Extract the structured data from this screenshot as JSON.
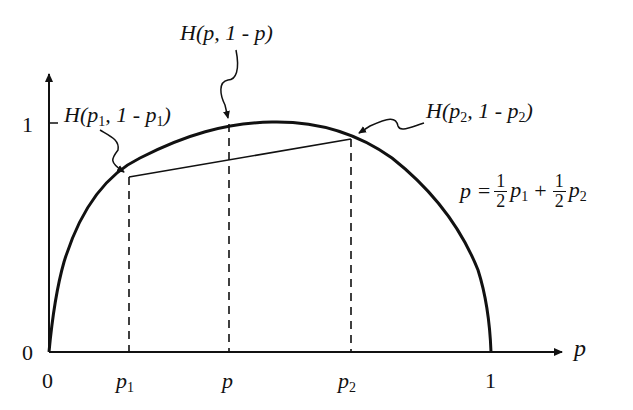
{
  "diagram": {
    "axes": {
      "x_label": "p",
      "y_origin_label": "0",
      "x_origin_label": "0",
      "y_tick_label": "1",
      "x_end_label": "1"
    },
    "x_ticks": {
      "p1": "p",
      "p1_sub": "1",
      "p": "p",
      "p2": "p",
      "p2_sub": "2"
    },
    "annotations": {
      "h_p": {
        "H": "H",
        "args": "(p, 1 - p)"
      },
      "h_p1": {
        "H": "H",
        "open": "(p",
        "sub1": "1",
        "mid": ", 1 - p",
        "sub2": "1",
        "close": ")"
      },
      "h_p2": {
        "H": "H",
        "open": "(p",
        "sub1": "2",
        "mid": ", 1 - p",
        "sub2": "2",
        "close": ")"
      }
    },
    "formula": {
      "lhs": "p =",
      "num1": "1",
      "den1": "2",
      "term1": "p",
      "term1_sub": "1",
      "plus": "+",
      "num2": "1",
      "den2": "2",
      "term2": "p",
      "term2_sub": "2"
    },
    "colors": {
      "ink": "#111111",
      "background": "#ffffff"
    }
  }
}
